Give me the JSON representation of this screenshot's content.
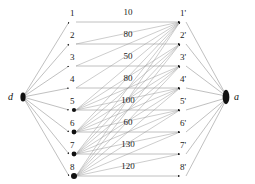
{
  "figure": {
    "name": "bipartite-assignment-graph",
    "background_color": "#ffffff",
    "edge_color": "#8c8c8c",
    "node_color": "#111111",
    "text_color": "#1a1a1a"
  },
  "terminals": [
    {
      "id": "d",
      "label": "d",
      "x": 16,
      "y": 97
    },
    {
      "id": "a",
      "label": "a",
      "x": 232,
      "y": 97
    }
  ],
  "left_nodes": [
    {
      "id": "L1",
      "label": "1",
      "x": 72,
      "y": 20
    },
    {
      "id": "L2",
      "label": "2",
      "x": 72,
      "y": 42
    },
    {
      "id": "L3",
      "label": "3",
      "x": 72,
      "y": 64
    },
    {
      "id": "L4",
      "label": "4",
      "x": 72,
      "y": 86
    },
    {
      "id": "L5",
      "label": "5",
      "x": 72,
      "y": 108
    },
    {
      "id": "L6",
      "label": "6",
      "x": 72,
      "y": 130
    },
    {
      "id": "L7",
      "label": "7",
      "x": 72,
      "y": 152
    },
    {
      "id": "L8",
      "label": "8",
      "x": 72,
      "y": 174
    }
  ],
  "right_nodes": [
    {
      "id": "R1",
      "label": "1'",
      "x": 182,
      "y": 20
    },
    {
      "id": "R2",
      "label": "2'",
      "x": 182,
      "y": 42
    },
    {
      "id": "R3",
      "label": "3'",
      "x": 182,
      "y": 64
    },
    {
      "id": "R4",
      "label": "4'",
      "x": 182,
      "y": 86
    },
    {
      "id": "R5",
      "label": "5'",
      "x": 182,
      "y": 108
    },
    {
      "id": "R6",
      "label": "6'",
      "x": 182,
      "y": 130
    },
    {
      "id": "R7",
      "label": "7'",
      "x": 182,
      "y": 152
    },
    {
      "id": "R8",
      "label": "8'",
      "x": 182,
      "y": 174
    }
  ],
  "weights": [
    {
      "row": 1,
      "value": "10",
      "x": 127,
      "y": 13
    },
    {
      "row": 2,
      "value": "80",
      "x": 127,
      "y": 35
    },
    {
      "row": 3,
      "value": "50",
      "x": 127,
      "y": 57
    },
    {
      "row": 4,
      "value": "80",
      "x": 127,
      "y": 79
    },
    {
      "row": 5,
      "value": "100",
      "x": 127,
      "y": 101
    },
    {
      "row": 6,
      "value": "60",
      "x": 127,
      "y": 123
    },
    {
      "row": 7,
      "value": "130",
      "x": 127,
      "y": 145
    },
    {
      "row": 8,
      "value": "120",
      "x": 127,
      "y": 167
    }
  ],
  "cross_edges": [
    {
      "from": "L2",
      "to": "R1"
    },
    {
      "from": "L3",
      "to": "R1"
    },
    {
      "from": "L4",
      "to": "R1"
    },
    {
      "from": "L5",
      "to": "R1"
    },
    {
      "from": "L6",
      "to": "R1"
    },
    {
      "from": "L7",
      "to": "R1"
    },
    {
      "from": "L8",
      "to": "R1"
    },
    {
      "from": "L5",
      "to": "R2"
    },
    {
      "from": "L6",
      "to": "R2"
    },
    {
      "from": "L7",
      "to": "R2"
    },
    {
      "from": "L8",
      "to": "R2"
    },
    {
      "from": "L5",
      "to": "R3"
    },
    {
      "from": "L6",
      "to": "R3"
    },
    {
      "from": "L7",
      "to": "R3"
    },
    {
      "from": "L8",
      "to": "R3"
    },
    {
      "from": "L5",
      "to": "R4"
    },
    {
      "from": "L6",
      "to": "R4"
    },
    {
      "from": "L7",
      "to": "R4"
    },
    {
      "from": "L8",
      "to": "R4"
    },
    {
      "from": "L6",
      "to": "R5"
    },
    {
      "from": "L7",
      "to": "R5"
    },
    {
      "from": "L8",
      "to": "R5"
    },
    {
      "from": "L7",
      "to": "R6"
    },
    {
      "from": "L8",
      "to": "R6"
    },
    {
      "from": "L8",
      "to": "R7"
    }
  ]
}
